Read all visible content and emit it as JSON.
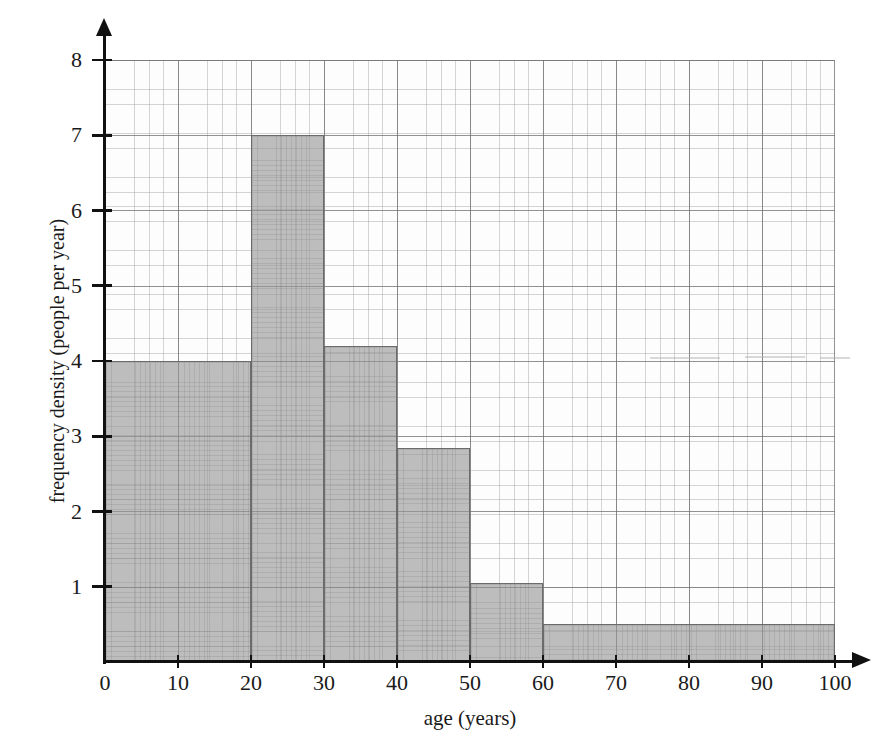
{
  "chart_data": {
    "type": "bar",
    "title": "",
    "subtitle": "",
    "xlabel": "age (years)",
    "ylabel": "frequency density (people per year)",
    "xlim": [
      0,
      100
    ],
    "ylim": [
      0,
      8
    ],
    "grid": true,
    "legend": null,
    "x_ticks": [
      "0",
      "10",
      "20",
      "30",
      "40",
      "50",
      "60",
      "70",
      "80",
      "90",
      "100"
    ],
    "x_tick_values": [
      0,
      10,
      20,
      30,
      40,
      50,
      60,
      70,
      80,
      90,
      100
    ],
    "y_ticks": [
      "1",
      "2",
      "3",
      "4",
      "5",
      "6",
      "7",
      "8"
    ],
    "y_tick_values": [
      1,
      2,
      3,
      4,
      5,
      6,
      7,
      8
    ],
    "bins": [
      {
        "label": "0-20",
        "x0": 0,
        "x1": 20,
        "value": 4.0,
        "frequency": 80
      },
      {
        "label": "20-30",
        "x0": 20,
        "x1": 30,
        "value": 7.0,
        "frequency": 70
      },
      {
        "label": "30-40",
        "x0": 30,
        "x1": 40,
        "value": 4.2,
        "frequency": 42
      },
      {
        "label": "40-50",
        "x0": 40,
        "x1": 50,
        "value": 2.85,
        "frequency": 28.5
      },
      {
        "label": "50-60",
        "x0": 50,
        "x1": 60,
        "value": 1.05,
        "frequency": 10.5
      },
      {
        "label": "60-100",
        "x0": 60,
        "x1": 100,
        "value": 0.5,
        "frequency": 20
      }
    ],
    "colors": {
      "bar_fill": "#969696",
      "bar_edge": "#6b6b6b",
      "axis": "#111111",
      "grid_minor": "#969696",
      "grid_major": "#6e6e6e",
      "background": "#ffffff"
    }
  },
  "axes": {
    "x_axis_name": "x-axis",
    "y_axis_name": "y-axis"
  }
}
